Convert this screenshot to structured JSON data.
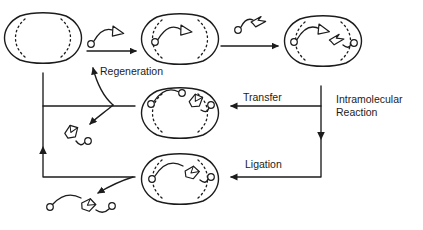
{
  "palette": {
    "ink": "#1c1c1c",
    "paper": "#ffffff"
  },
  "diagram": {
    "labels": {
      "regeneration": "Regeneration",
      "transfer": "Transfer",
      "intramolecular_line1": "Intramolecular",
      "intramolecular_line2": "Reaction",
      "ligation": "Ligation"
    },
    "glyphs": {
      "host": "open-barrel-macrocycle",
      "strand_end": "small-open-circle",
      "substrate_a_head": "open-triangle",
      "substrate_b_head": "crumpled-flag",
      "product_core": "folded-diamond"
    }
  }
}
